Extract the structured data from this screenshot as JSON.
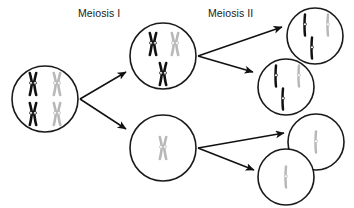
{
  "figure": {
    "background_color": "#ffffff",
    "width": 354,
    "height": 208,
    "clipped_top_caption": "chromosomes duplicate"
  },
  "labels": {
    "meiosis_one": "Meiosis I",
    "meiosis_two": "Meiosis II"
  },
  "colors": {
    "outline": "#1a1a1a",
    "maternal_chromosome": "#111111",
    "paternal_chromosome": "#b8b8b8",
    "arrow": "#111111",
    "cell_fill": "#ffffff"
  },
  "cells": [
    {
      "id": "parent-cell",
      "name": "parent-diploid-cell",
      "stage": "before Meiosis I",
      "cx": 45,
      "cy": 99,
      "r": 33,
      "contents": [
        {
          "type": "duplicated-chromosome",
          "color": "black",
          "x": 33,
          "y": 84
        },
        {
          "type": "duplicated-chromosome",
          "color": "gray",
          "x": 57,
          "y": 84
        },
        {
          "type": "duplicated-chromosome",
          "color": "black",
          "x": 33,
          "y": 114
        },
        {
          "type": "duplicated-chromosome",
          "color": "gray",
          "x": 57,
          "y": 114
        }
      ]
    },
    {
      "id": "meiosis1-upper-cell",
      "name": "meiosis-one-upper-daughter-cell",
      "stage": "after Meiosis I",
      "cx": 163,
      "cy": 56,
      "r": 33,
      "contents": [
        {
          "type": "duplicated-chromosome",
          "color": "black",
          "x": 153,
          "y": 44
        },
        {
          "type": "duplicated-chromosome",
          "color": "gray",
          "x": 175,
          "y": 44
        },
        {
          "type": "duplicated-chromosome",
          "color": "black",
          "x": 163,
          "y": 73
        }
      ]
    },
    {
      "id": "meiosis1-lower-cell",
      "name": "meiosis-one-lower-daughter-cell",
      "stage": "after Meiosis I",
      "cx": 163,
      "cy": 148,
      "r": 33,
      "contents": [
        {
          "type": "duplicated-chromosome",
          "color": "gray",
          "x": 163,
          "y": 148
        }
      ]
    },
    {
      "id": "gamete-1",
      "name": "gamete-cell-one",
      "stage": "after Meiosis II",
      "cx": 315,
      "cy": 36,
      "r": 28,
      "contents": [
        {
          "type": "single-chromatid",
          "color": "black",
          "x": 305,
          "y": 25
        },
        {
          "type": "single-chromatid",
          "color": "gray",
          "x": 327,
          "y": 25
        },
        {
          "type": "single-chromatid",
          "color": "black",
          "x": 312,
          "y": 48
        }
      ]
    },
    {
      "id": "gamete-2",
      "name": "gamete-cell-two",
      "stage": "after Meiosis II",
      "cx": 286,
      "cy": 87,
      "r": 28,
      "contents": [
        {
          "type": "single-chromatid",
          "color": "black",
          "x": 276,
          "y": 76
        },
        {
          "type": "single-chromatid",
          "color": "gray",
          "x": 298,
          "y": 76
        },
        {
          "type": "single-chromatid",
          "color": "black",
          "x": 283,
          "y": 99
        }
      ]
    },
    {
      "id": "gamete-3",
      "name": "gamete-cell-three",
      "stage": "after Meiosis II",
      "cx": 316,
      "cy": 142,
      "r": 28,
      "contents": [
        {
          "type": "single-chromatid",
          "color": "gray",
          "x": 316,
          "y": 142
        }
      ]
    },
    {
      "id": "gamete-4",
      "name": "gamete-cell-four",
      "stage": "after Meiosis II",
      "cx": 286,
      "cy": 177,
      "r": 28,
      "contents": [
        {
          "type": "single-chromatid",
          "color": "gray",
          "x": 286,
          "y": 177
        }
      ]
    }
  ],
  "arrows": [
    {
      "id": "arrow-parent-to-upper",
      "name": "arrow-parent-to-meiosis1-upper",
      "from": "parent-cell",
      "to": "meiosis1-upper-cell",
      "x1": 80,
      "y1": 99,
      "x2": 128,
      "y2": 72
    },
    {
      "id": "arrow-parent-to-lower",
      "name": "arrow-parent-to-meiosis1-lower",
      "from": "parent-cell",
      "to": "meiosis1-lower-cell",
      "x1": 80,
      "y1": 99,
      "x2": 128,
      "y2": 130
    },
    {
      "id": "arrow-upper-to-gamete1",
      "name": "arrow-meiosis1-upper-to-gamete-one",
      "from": "meiosis1-upper-cell",
      "to": "gamete-1",
      "x1": 198,
      "y1": 56,
      "x2": 284,
      "y2": 28
    },
    {
      "id": "arrow-upper-to-gamete2",
      "name": "arrow-meiosis1-upper-to-gamete-two",
      "from": "meiosis1-upper-cell",
      "to": "gamete-2",
      "x1": 198,
      "y1": 56,
      "x2": 255,
      "y2": 73
    },
    {
      "id": "arrow-lower-to-gamete3",
      "name": "arrow-meiosis1-lower-to-gamete-three",
      "from": "meiosis1-lower-cell",
      "to": "gamete-3",
      "x1": 198,
      "y1": 148,
      "x2": 286,
      "y2": 132
    },
    {
      "id": "arrow-lower-to-gamete4",
      "name": "arrow-meiosis1-lower-to-gamete-four",
      "from": "meiosis1-lower-cell",
      "to": "gamete-4",
      "x1": 198,
      "y1": 148,
      "x2": 256,
      "y2": 171
    }
  ]
}
